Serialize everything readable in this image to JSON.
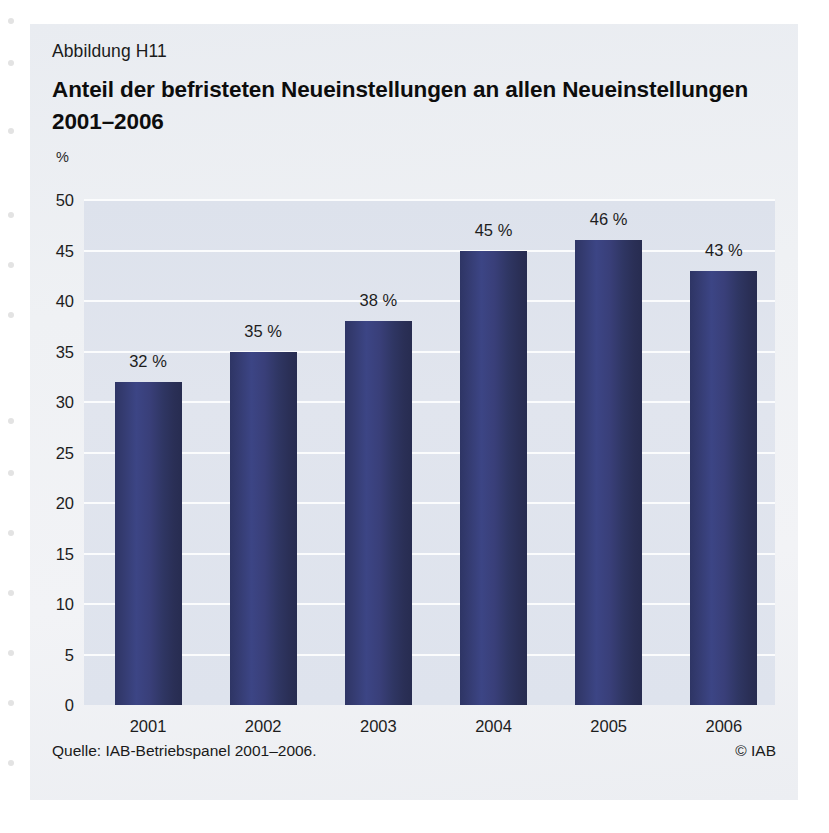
{
  "figure": {
    "number": "Abbildung H11",
    "title_line1": "Anteil der befristeten Neueinstellungen an allen Neueinstellungen",
    "title_line2": "2001–2006",
    "source": "Quelle: IAB-Betriebspanel 2001–2006.",
    "copyright": "© IAB"
  },
  "chart_data": {
    "type": "bar",
    "title": "Anteil der befristeten Neueinstellungen an allen Neueinstellungen 2001–2006",
    "xlabel": "",
    "ylabel": "%",
    "yunit": "%",
    "ylim": [
      0,
      50
    ],
    "ytick_step": 5,
    "yticks": [
      "50",
      "45",
      "40",
      "35",
      "30",
      "25",
      "20",
      "15",
      "10",
      "5",
      "0"
    ],
    "ytick_values": [
      50,
      45,
      40,
      35,
      30,
      25,
      20,
      15,
      10,
      5,
      0
    ],
    "grid": true,
    "legend": null,
    "categories": [
      "2001",
      "2002",
      "2003",
      "2004",
      "2005",
      "2006"
    ],
    "values": [
      32,
      35,
      38,
      45,
      46,
      43
    ],
    "data_labels": [
      "32 %",
      "35 %",
      "38 %",
      "45 %",
      "46 %",
      "43 %"
    ],
    "bar_color": "#343b70",
    "plot_background": "#dfe3ed",
    "gridline_color": "#fbfcfd"
  }
}
